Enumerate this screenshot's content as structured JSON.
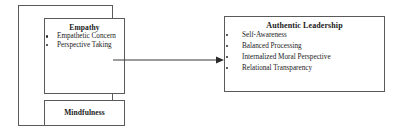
{
  "diagram": {
    "title": "",
    "nodes": {
      "empathy": {
        "title": "Empathy",
        "items": [
          "Empathetic Concern",
          "Perspective Taking"
        ]
      },
      "mindfulness": {
        "title": "Mindfulness",
        "items": []
      },
      "authentic_leadership": {
        "title": "Authentic Leadership",
        "items": [
          "Self-Awareness",
          "Balanced Processing",
          "Internalized Moral Perspective",
          "Relational Transparency"
        ]
      }
    },
    "connector": {
      "name": "arrow-empathy-mindfulness-to-authentic-leadership",
      "from": "empathy-mindfulness-group",
      "to": "authentic-leadership",
      "direction": "right",
      "style": "solid-line-with-arrowhead"
    },
    "colors": {
      "border": "#5a5a5a",
      "text": "#1a1a1a",
      "background": "#ffffff",
      "bullet": "#2a2a2a",
      "arrow": "#3a3a3a"
    }
  }
}
